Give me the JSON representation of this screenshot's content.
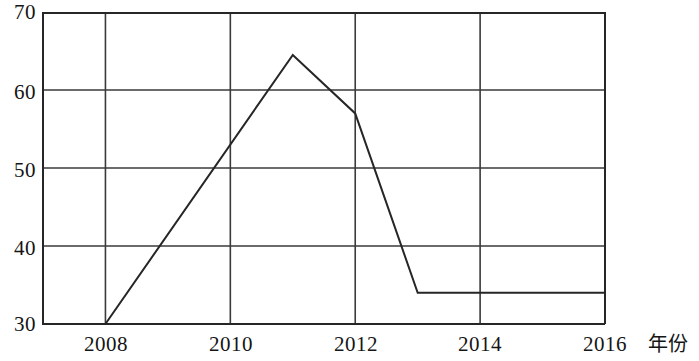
{
  "chart_data": {
    "type": "line",
    "title": "",
    "subtitle": "",
    "xlabel": "年份",
    "ylabel": "",
    "xlim": [
      2007,
      2016
    ],
    "ylim": [
      30,
      70
    ],
    "grid": true,
    "legend": "none",
    "x_ticks": [
      "2008",
      "2010",
      "2012",
      "2014",
      "2016"
    ],
    "x_tick_values": [
      2008,
      2010,
      2012,
      2014,
      2016
    ],
    "y_ticks": [
      "30",
      "40",
      "50",
      "60",
      "70"
    ],
    "y_tick_values": [
      30,
      40,
      50,
      60,
      70
    ],
    "series": [
      {
        "name": "数值",
        "x": [
          2008,
          2011,
          2012,
          2013,
          2016
        ],
        "values": [
          30,
          64.5,
          57,
          34,
          34
        ],
        "points": [
          {
            "x": 2008,
            "y": 30
          },
          {
            "x": 2011,
            "y": 64.5
          },
          {
            "x": 2012,
            "y": 57
          },
          {
            "x": 2013,
            "y": 34
          },
          {
            "x": 2016,
            "y": 34
          }
        ]
      }
    ],
    "colors": {
      "line": "#262626",
      "grid": "#3a3a3a",
      "axis": "#262626",
      "background": "#ffffff"
    }
  }
}
